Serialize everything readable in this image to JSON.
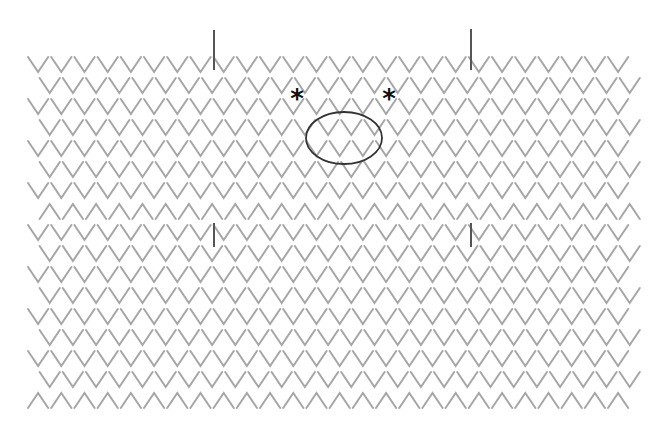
{
  "diagram": {
    "type": "knitting-stitch-chart",
    "colors": {
      "background": "#ffffff",
      "stitch": "#a6a6a6",
      "marker": "#555555",
      "oval": "#333333",
      "asterisk": "#111111"
    },
    "grid": {
      "stitch_width": 23.2,
      "stitch_height": 15,
      "row_pitch": 21,
      "first_row_top": 57,
      "base_x": 28,
      "offset_x": 11.6,
      "stitches_per_row": 26
    },
    "rows": [
      {
        "shape": "V",
        "offset": false
      },
      {
        "shape": "V",
        "offset": true
      },
      {
        "shape": "V",
        "offset": false
      },
      {
        "shape": "V",
        "offset": true
      },
      {
        "shape": "V",
        "offset": false
      },
      {
        "shape": "V",
        "offset": true
      },
      {
        "shape": "V",
        "offset": false
      },
      {
        "shape": "^",
        "offset": true
      },
      {
        "shape": "V",
        "offset": false
      },
      {
        "shape": "V",
        "offset": true
      },
      {
        "shape": "V",
        "offset": false
      },
      {
        "shape": "V",
        "offset": true
      },
      {
        "shape": "V",
        "offset": false
      },
      {
        "shape": "V",
        "offset": true
      },
      {
        "shape": "V",
        "offset": false
      },
      {
        "shape": "V",
        "offset": true
      },
      {
        "shape": "^",
        "offset": false
      }
    ],
    "markers": [
      {
        "name": "marker-top-left",
        "x": 214,
        "y1": 30,
        "y2": 70
      },
      {
        "name": "marker-top-right",
        "x": 471,
        "y1": 29,
        "y2": 70
      },
      {
        "name": "marker-mid-left",
        "x": 214,
        "y1": 223,
        "y2": 247
      },
      {
        "name": "marker-mid-right",
        "x": 471,
        "y1": 223,
        "y2": 247
      }
    ],
    "asterisks": [
      {
        "name": "asterisk-left",
        "x": 297,
        "y": 108,
        "glyph": "*"
      },
      {
        "name": "asterisk-right",
        "x": 389,
        "y": 108,
        "glyph": "*"
      }
    ],
    "oval": {
      "cx": 344,
      "cy": 138,
      "rx": 38,
      "ry": 26
    }
  }
}
